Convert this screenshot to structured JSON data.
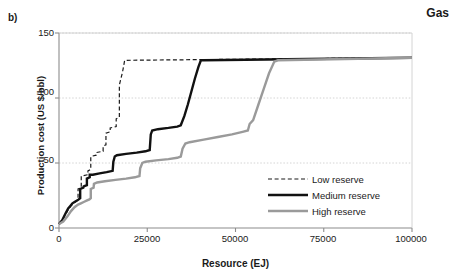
{
  "panel": {
    "label": "b)"
  },
  "chart_data": {
    "type": "line",
    "title": "Gas",
    "xlabel": "Resource (EJ)",
    "ylabel": "Production cost (US $/bbl)",
    "xlim": [
      0,
      100000
    ],
    "ylim": [
      0,
      150
    ],
    "xticks": [
      "0",
      "25000",
      "50000",
      "75000",
      "100000"
    ],
    "xtick_values": [
      0,
      25000,
      50000,
      75000,
      100000
    ],
    "yticks": [
      "0",
      "50",
      "100",
      "150"
    ],
    "ytick_values": [
      0,
      50,
      100,
      150
    ],
    "grid": "horizontal-dotted",
    "legend_position": "lower-right",
    "series": [
      {
        "name": "Low reserve",
        "style": "dashed",
        "color": "#1a1a1a",
        "width": 1.2,
        "points": [
          [
            0,
            3
          ],
          [
            900,
            6
          ],
          [
            1800,
            10
          ],
          [
            2600,
            14
          ],
          [
            3400,
            17
          ],
          [
            4200,
            19
          ],
          [
            5000,
            21
          ],
          [
            5400,
            22
          ],
          [
            5400,
            30
          ],
          [
            6300,
            31
          ],
          [
            6300,
            40
          ],
          [
            8200,
            41
          ],
          [
            8200,
            44
          ],
          [
            9000,
            45
          ],
          [
            9000,
            55
          ],
          [
            10500,
            56
          ],
          [
            10500,
            58
          ],
          [
            12500,
            59
          ],
          [
            12500,
            63
          ],
          [
            13300,
            64
          ],
          [
            13300,
            73
          ],
          [
            14500,
            74
          ],
          [
            14500,
            77
          ],
          [
            16200,
            78
          ],
          [
            16200,
            84
          ],
          [
            17100,
            85
          ],
          [
            17100,
            110
          ],
          [
            18000,
            120
          ],
          [
            18600,
            129
          ],
          [
            19000,
            129
          ],
          [
            100000,
            131
          ]
        ]
      },
      {
        "name": "Medium reserve",
        "style": "solid",
        "color": "#111111",
        "width": 2.4,
        "points": [
          [
            0,
            3
          ],
          [
            900,
            6
          ],
          [
            1800,
            11
          ],
          [
            2600,
            15
          ],
          [
            3200,
            17
          ],
          [
            3800,
            19
          ],
          [
            4400,
            20
          ],
          [
            5000,
            21
          ],
          [
            5600,
            22
          ],
          [
            6000,
            23
          ],
          [
            6000,
            30
          ],
          [
            6900,
            31
          ],
          [
            7000,
            32
          ],
          [
            7900,
            33
          ],
          [
            7900,
            38
          ],
          [
            8700,
            39
          ],
          [
            8700,
            41
          ],
          [
            9600,
            41
          ],
          [
            11500,
            42
          ],
          [
            13500,
            43
          ],
          [
            15200,
            44
          ],
          [
            15400,
            51
          ],
          [
            15800,
            55
          ],
          [
            16400,
            56
          ],
          [
            19000,
            57
          ],
          [
            22000,
            58
          ],
          [
            24500,
            59
          ],
          [
            25700,
            60
          ],
          [
            26000,
            72
          ],
          [
            26400,
            75
          ],
          [
            28000,
            76
          ],
          [
            31000,
            77
          ],
          [
            33500,
            78
          ],
          [
            34500,
            79
          ],
          [
            35500,
            86
          ],
          [
            36500,
            95
          ],
          [
            37500,
            105
          ],
          [
            38500,
            115
          ],
          [
            39500,
            124
          ],
          [
            40200,
            129
          ],
          [
            41000,
            129
          ],
          [
            100000,
            131
          ]
        ]
      },
      {
        "name": "High reserve",
        "style": "solid",
        "color": "#9a9a9a",
        "width": 2.4,
        "points": [
          [
            0,
            3
          ],
          [
            1200,
            5
          ],
          [
            2400,
            9
          ],
          [
            3400,
            13
          ],
          [
            4400,
            16
          ],
          [
            5400,
            18
          ],
          [
            6200,
            19
          ],
          [
            7000,
            20
          ],
          [
            7800,
            21
          ],
          [
            8600,
            22
          ],
          [
            9000,
            23
          ],
          [
            9000,
            30
          ],
          [
            9800,
            31
          ],
          [
            9900,
            34
          ],
          [
            10800,
            35
          ],
          [
            13000,
            36
          ],
          [
            16000,
            37
          ],
          [
            19000,
            38
          ],
          [
            21500,
            39
          ],
          [
            22800,
            40
          ],
          [
            23000,
            46
          ],
          [
            23600,
            50
          ],
          [
            24500,
            51
          ],
          [
            27500,
            52
          ],
          [
            31000,
            53
          ],
          [
            33500,
            54
          ],
          [
            34500,
            55
          ],
          [
            35000,
            61
          ],
          [
            35800,
            65
          ],
          [
            37000,
            66
          ],
          [
            41000,
            68
          ],
          [
            45000,
            70
          ],
          [
            49000,
            72
          ],
          [
            52000,
            74
          ],
          [
            53500,
            75
          ],
          [
            54000,
            80
          ],
          [
            55000,
            83
          ],
          [
            56500,
            95
          ],
          [
            58000,
            107
          ],
          [
            59500,
            119
          ],
          [
            61000,
            128
          ],
          [
            62000,
            129
          ],
          [
            100000,
            131
          ]
        ]
      }
    ]
  },
  "legend": {
    "items": [
      {
        "label": "Low reserve",
        "style": "dashed",
        "color": "#1a1a1a"
      },
      {
        "label": "Medium reserve",
        "style": "solid",
        "color": "#111111"
      },
      {
        "label": "High reserve",
        "style": "solid",
        "color": "#9a9a9a"
      }
    ]
  },
  "axis_colors": {
    "axis": "#8c8c8c",
    "grid": "#c9c9c9"
  }
}
